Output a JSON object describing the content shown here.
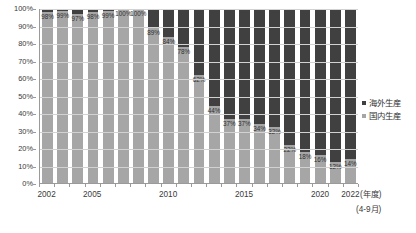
{
  "chart_data": {
    "type": "bar",
    "stacked": true,
    "title": "",
    "subtitle": "",
    "xlabel": "(年度)",
    "ylabel": "",
    "ylim": [
      0,
      100
    ],
    "y_unit": "%",
    "grid": true,
    "legend_position": "right",
    "x_axis_note": "(4-9月)",
    "categories": [
      "2002",
      "2003",
      "2004",
      "2005",
      "2006",
      "2007",
      "2008",
      "2009",
      "2010",
      "2011",
      "2012",
      "2013",
      "2014",
      "2015",
      "2016",
      "2017",
      "2018",
      "2019",
      "2020",
      "2021",
      "2022"
    ],
    "x_tick_labels": [
      {
        "category": "2002",
        "label": "2002"
      },
      {
        "category": "2005",
        "label": "2005"
      },
      {
        "category": "2010",
        "label": "2010"
      },
      {
        "category": "2015",
        "label": "2015"
      },
      {
        "category": "2020",
        "label": "2020"
      },
      {
        "category": "2022",
        "label": "2022"
      }
    ],
    "y_tick_labels": [
      "0%",
      "10%",
      "20%",
      "30%",
      "40%",
      "50%",
      "60%",
      "70%",
      "80%",
      "90%",
      "100%"
    ],
    "y_tick_values": [
      0,
      10,
      20,
      30,
      40,
      50,
      60,
      70,
      80,
      90,
      100
    ],
    "series": [
      {
        "name": "国内生産",
        "color": "#a6a6a6",
        "values": [
          98,
          99,
          97,
          98,
          99,
          100,
          100,
          89,
          84,
          78,
          62,
          44,
          37,
          37,
          34,
          32,
          22,
          18,
          16,
          12,
          14
        ],
        "data_labels": [
          "98%",
          "99%",
          "97%",
          "98%",
          "99%",
          "100%",
          "100%",
          "89%",
          "84%",
          "78%",
          "62%",
          "44%",
          "37%",
          "37%",
          "34%",
          "32%",
          "22%",
          "18%",
          "16%",
          "12%",
          "14%"
        ]
      },
      {
        "name": "海外生産",
        "color": "#404040",
        "values": [
          2,
          1,
          3,
          2,
          1,
          0,
          0,
          11,
          16,
          22,
          38,
          56,
          63,
          63,
          66,
          68,
          78,
          82,
          84,
          88,
          86
        ],
        "data_labels": []
      }
    ],
    "legend": [
      {
        "label": "海外生産",
        "color": "#404040"
      },
      {
        "label": "国内生産",
        "color": "#a6a6a6"
      }
    ]
  }
}
